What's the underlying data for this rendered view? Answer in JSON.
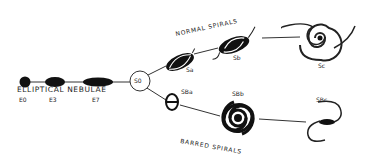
{
  "diagram": {
    "headings": {
      "elliptical": "ELLIPTICAL NEBULAE",
      "normal": "NORMAL SPIRALS",
      "barred": "BARRED SPIRALS"
    },
    "ellipticals": [
      {
        "label": "E0"
      },
      {
        "label": "E3"
      },
      {
        "label": "E7"
      }
    ],
    "lenticular": {
      "label": "S0"
    },
    "normal_spirals": [
      {
        "label": "Sa"
      },
      {
        "label": "Sb"
      },
      {
        "label": "Sc"
      }
    ],
    "barred_spirals": [
      {
        "label": "SBa"
      },
      {
        "label": "SBb"
      },
      {
        "label": "SBc"
      }
    ],
    "colors": {
      "ink": "#111111",
      "background": "#ffffff"
    }
  }
}
